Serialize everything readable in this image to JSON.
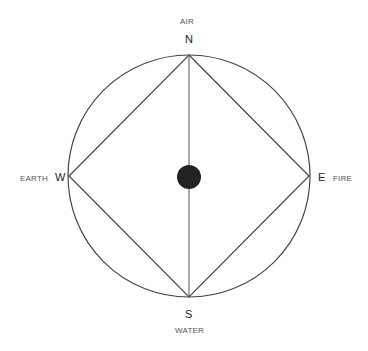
{
  "diagram": {
    "type": "compass-elements",
    "directions": {
      "north": {
        "letter": "N",
        "element": "AIR"
      },
      "south": {
        "letter": "S",
        "element": "WATER"
      },
      "west": {
        "letter": "W",
        "element": "EARTH"
      },
      "east": {
        "letter": "E",
        "element": "FIRE"
      }
    },
    "colors": {
      "stroke": "#444444",
      "center_dot": "#222222",
      "label": "#555555",
      "letter": "#222222"
    }
  }
}
